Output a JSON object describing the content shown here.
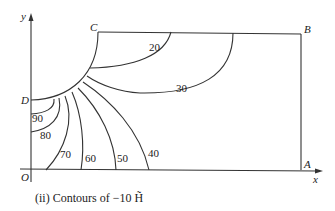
{
  "diagram": {
    "axes": {
      "x_label": "x",
      "y_label": "y",
      "origin_label": "O"
    },
    "points": {
      "A": "A",
      "B": "B",
      "C": "C",
      "D": "D"
    },
    "contour_labels": [
      "20",
      "30",
      "40",
      "50",
      "60",
      "70",
      "80",
      "90"
    ],
    "caption": "(ii) Contours of −10 H̃"
  }
}
